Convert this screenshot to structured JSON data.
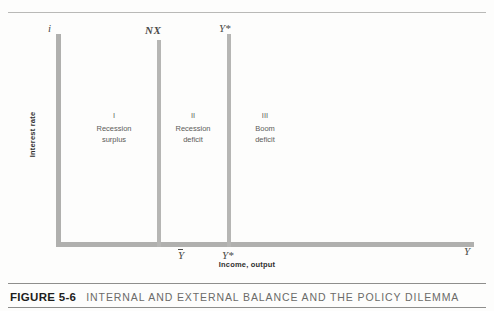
{
  "figure": {
    "caption_number": "FIGURE 5-6",
    "caption_title": "INTERNAL AND EXTERNAL BALANCE AND THE POLICY DILEMMA"
  },
  "axes": {
    "y_title": "Interest rate",
    "x_title": "Income, output",
    "y_axis_end_label": "i",
    "x_axis_end_label": "Y",
    "x_ticks": [
      {
        "label": "Y",
        "overbar": true,
        "position": "NX"
      },
      {
        "label": "Y*",
        "overbar": false,
        "position": "potential-output"
      }
    ]
  },
  "schedules": [
    {
      "name": "nx-schedule",
      "label": "NX"
    },
    {
      "name": "ystar-schedule",
      "label": "Y*"
    }
  ],
  "regions": [
    {
      "roman": "I",
      "line1": "Recession",
      "line2": "surplus"
    },
    {
      "roman": "II",
      "line1": "Recession",
      "line2": "deficit"
    },
    {
      "roman": "III",
      "line1": "Boom",
      "line2": "deficit"
    }
  ],
  "colors": {
    "axis": "#b0b0ae",
    "schedule": "#b6b6b4",
    "caption_number": "#1d1d1c",
    "caption_title": "#6b6b69",
    "region_text": "#5c5c5a",
    "rule": "#8e8e8c"
  },
  "chart_data": {
    "type": "line",
    "title": "INTERNAL AND EXTERNAL BALANCE AND THE POLICY DILEMMA",
    "xlabel": "Income, output",
    "ylabel": "Interest rate",
    "grid": false,
    "legend": "none",
    "series": [
      {
        "name": "NX",
        "orientation": "vertical",
        "x": "Y-bar"
      },
      {
        "name": "Y*",
        "orientation": "vertical",
        "x": "Y*"
      }
    ],
    "xtick_labels": [
      "Ȳ",
      "Y*",
      "Y"
    ],
    "annotations": [
      {
        "text": "I Recession surplus",
        "region": "left-of-NX"
      },
      {
        "text": "II Recession deficit",
        "region": "between-NX-and-Ystar"
      },
      {
        "text": "III Boom deficit",
        "region": "right-of-Ystar"
      }
    ]
  }
}
